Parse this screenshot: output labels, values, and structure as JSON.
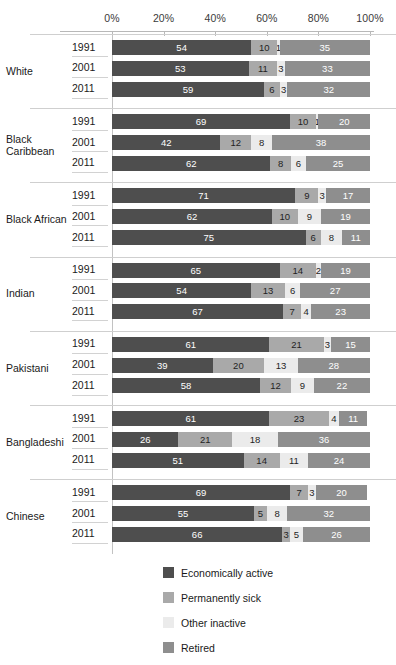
{
  "chart_data": {
    "type": "bar",
    "subtype": "stacked-horizontal-100pct",
    "title": "",
    "xlabel": "",
    "ylabel": "",
    "xlim": [
      0,
      100
    ],
    "grid": false,
    "legend_position": "bottom",
    "axis_ticks": [
      "0%",
      "20%",
      "40%",
      "60%",
      "80%",
      "100%"
    ],
    "axis_tick_values": [
      0,
      20,
      40,
      60,
      80,
      100
    ],
    "series": [
      {
        "name": "Economically active",
        "color": "#4e4e4e",
        "key": "active"
      },
      {
        "name": "Permanently sick",
        "color": "#a9a9a9",
        "key": "sick"
      },
      {
        "name": "Other inactive",
        "color": "#ebebeb",
        "key": "other"
      },
      {
        "name": "Retired",
        "color": "#8e8e8e",
        "key": "retired"
      }
    ],
    "groups": [
      {
        "label": "White",
        "rows": [
          {
            "year": "1991",
            "values": [
              54,
              10,
              1,
              35
            ]
          },
          {
            "year": "2001",
            "values": [
              53,
              11,
              3,
              33
            ]
          },
          {
            "year": "2011",
            "values": [
              59,
              6,
              3,
              32
            ]
          }
        ]
      },
      {
        "label": "Black Caribbean",
        "rows": [
          {
            "year": "1991",
            "values": [
              69,
              10,
              1,
              20
            ]
          },
          {
            "year": "2001",
            "values": [
              42,
              12,
              8,
              38
            ]
          },
          {
            "year": "2011",
            "values": [
              62,
              8,
              6,
              25
            ]
          }
        ]
      },
      {
        "label": "Black African",
        "rows": [
          {
            "year": "1991",
            "values": [
              71,
              9,
              3,
              17
            ]
          },
          {
            "year": "2001",
            "values": [
              62,
              10,
              9,
              19
            ]
          },
          {
            "year": "2011",
            "values": [
              75,
              6,
              8,
              11
            ]
          }
        ]
      },
      {
        "label": "Indian",
        "rows": [
          {
            "year": "1991",
            "values": [
              65,
              14,
              2,
              19
            ]
          },
          {
            "year": "2001",
            "values": [
              54,
              13,
              6,
              27
            ]
          },
          {
            "year": "2011",
            "values": [
              67,
              7,
              4,
              23
            ]
          }
        ]
      },
      {
        "label": "Pakistani",
        "rows": [
          {
            "year": "1991",
            "values": [
              61,
              21,
              3,
              15
            ]
          },
          {
            "year": "2001",
            "values": [
              39,
              20,
              13,
              28
            ]
          },
          {
            "year": "2011",
            "values": [
              58,
              12,
              9,
              22
            ]
          }
        ]
      },
      {
        "label": "Bangladeshi",
        "rows": [
          {
            "year": "1991",
            "values": [
              61,
              23,
              4,
              11
            ]
          },
          {
            "year": "2001",
            "values": [
              26,
              21,
              18,
              36
            ]
          },
          {
            "year": "2011",
            "values": [
              51,
              14,
              11,
              24
            ]
          }
        ]
      },
      {
        "label": "Chinese",
        "rows": [
          {
            "year": "1991",
            "values": [
              69,
              7,
              3,
              20
            ]
          },
          {
            "year": "2001",
            "values": [
              55,
              5,
              8,
              32
            ]
          },
          {
            "year": "2011",
            "values": [
              66,
              3,
              5,
              26
            ]
          }
        ]
      }
    ]
  }
}
